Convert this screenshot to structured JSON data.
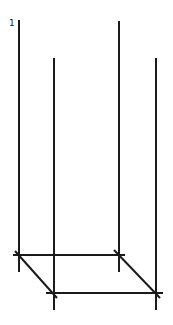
{
  "diagram": {
    "label": "1",
    "stroke_color": "#1a1a1a",
    "background": "#ffffff",
    "verticals": [
      {
        "name": "back-left",
        "x": 19,
        "y1": 20,
        "y2": 272
      },
      {
        "name": "back-right",
        "x": 119,
        "y1": 21,
        "y2": 272
      },
      {
        "name": "front-left",
        "x": 54,
        "y1": 58,
        "y2": 310
      },
      {
        "name": "front-right",
        "x": 156,
        "y1": 58,
        "y2": 310
      }
    ],
    "horizontals": [
      {
        "name": "back-edge",
        "y": 255,
        "x1": 13,
        "x2": 125
      },
      {
        "name": "front-edge",
        "y": 293,
        "x1": 46,
        "x2": 163
      }
    ],
    "diagonals": [
      {
        "name": "left-side",
        "x1": 15,
        "y1": 251,
        "x2": 57,
        "y2": 298
      },
      {
        "name": "right-side",
        "x1": 114,
        "y1": 250,
        "x2": 160,
        "y2": 298
      }
    ]
  }
}
